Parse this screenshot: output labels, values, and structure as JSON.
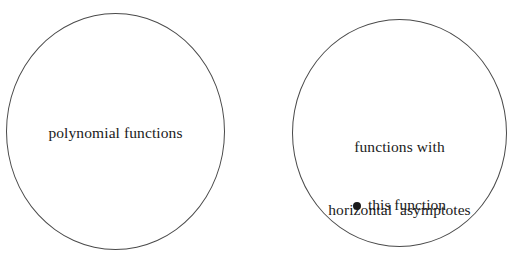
{
  "diagram": {
    "background_color": "#ffffff",
    "stroke_color": "#4a4a4a",
    "text_color": "#1b1b1b",
    "sets": [
      {
        "id": "polynomial-functions",
        "label": "polynomial functions",
        "shape": "ellipse"
      },
      {
        "id": "functions-with-horizontal-asymptotes",
        "label_line_1": "functions with",
        "label_line_2": "horizontal  asymptotes",
        "shape": "ellipse"
      }
    ],
    "member": {
      "bullet_icon": "filled-dot-icon",
      "bullet_color": "#1b1b1b",
      "label": "this function"
    }
  }
}
